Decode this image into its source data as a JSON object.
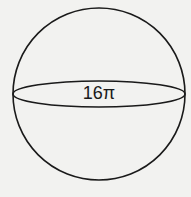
{
  "diagram": {
    "shape": "sphere",
    "great_circle_label": "16π",
    "colors": {
      "stroke": "#1a1a1a",
      "background": "#f2f2f0"
    }
  }
}
